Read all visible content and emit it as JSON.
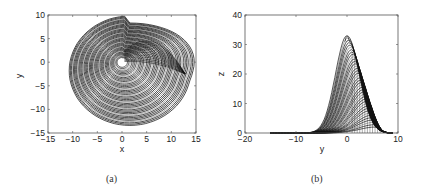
{
  "chart_data": [
    {
      "type": "line",
      "panel": "(a)",
      "description": "Chaotic attractor projected on x-y plane: dense spiral trajectories around origin",
      "xlabel": "x",
      "ylabel": "y",
      "xlim": [
        -15,
        15
      ],
      "ylim": [
        -15,
        10
      ],
      "xticks": [
        -15,
        -10,
        -5,
        0,
        5,
        10,
        15
      ],
      "yticks": [
        -15,
        -10,
        -5,
        0,
        5,
        10
      ],
      "grid": false,
      "legend": null,
      "approx_extent": {
        "x": [
          -10.5,
          14
        ],
        "y": [
          -13,
          9.5
        ]
      },
      "center": [
        0,
        0
      ]
    },
    {
      "type": "line",
      "panel": "(b)",
      "description": "Attractor projected on y-z plane: family of bell-shaped curves peaking near y=0",
      "xlabel": "y",
      "ylabel": "z",
      "xlim": [
        -20,
        10
      ],
      "ylim": [
        0,
        40
      ],
      "xticks": [
        -20,
        -10,
        0,
        10
      ],
      "yticks": [
        0,
        10,
        20,
        30,
        40
      ],
      "grid": false,
      "legend": null,
      "peak": {
        "y": 0,
        "z": 33
      },
      "approx_extent": {
        "y": [
          -15,
          9
        ],
        "z": [
          0,
          33
        ]
      }
    }
  ],
  "captions": {
    "a": "(a)",
    "b": "(b)"
  },
  "axes": {
    "a": {
      "xlabel": "x",
      "ylabel": "y",
      "xticks": [
        "−15",
        "−10",
        "−5",
        "0",
        "5",
        "10",
        "15"
      ],
      "yticks": [
        "−15",
        "−10",
        "−5",
        "0",
        "5",
        "10"
      ]
    },
    "b": {
      "xlabel": "y",
      "ylabel": "z",
      "xticks": [
        "−20",
        "−10",
        "0",
        "10"
      ],
      "yticks": [
        "0",
        "10",
        "20",
        "30",
        "40"
      ]
    }
  }
}
